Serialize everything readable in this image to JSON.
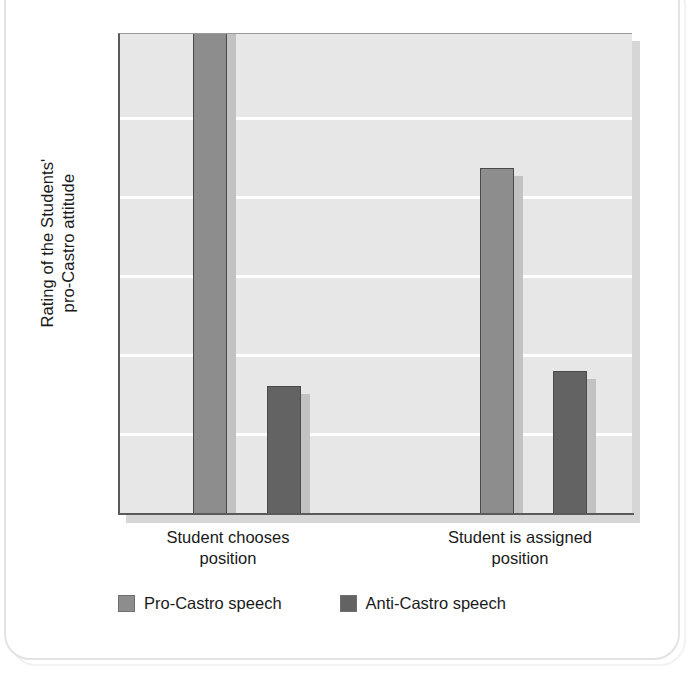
{
  "figure": {
    "ylabel": "Rating of the Students'\npro-Castro attitude",
    "plot_bg": "#e7e7e7",
    "gridline_color": "#ffffff",
    "axis_color": "#5a5a5a"
  },
  "legend": {
    "items": [
      {
        "label": "Pro-Castro speech",
        "color": "#8d8d8d"
      },
      {
        "label": "Anti-Castro speech",
        "color": "#636363"
      }
    ]
  },
  "chart_data": {
    "type": "bar",
    "title": "",
    "xlabel": "",
    "ylabel": "Rating of the Students' pro-Castro attitude",
    "categories": [
      "Student chooses\nposition",
      "Student is assigned\nposition"
    ],
    "category_labels_flat": [
      "Student chooses position",
      "Student is assigned position"
    ],
    "series": [
      {
        "name": "Pro-Castro speech",
        "color": "#8d8d8d",
        "values": [
          6.35,
          4.45
        ]
      },
      {
        "name": "Anti-Castro speech",
        "color": "#636363",
        "values": [
          1.68,
          1.88
        ]
      }
    ],
    "ylim": [
      0,
      6.1
    ],
    "grid": true,
    "gridlines_y": [
      1,
      2,
      3,
      4,
      5,
      6
    ],
    "y_tick_labels": [],
    "legend_position": "bottom"
  },
  "geometry": {
    "plot": {
      "left": 118,
      "top": 33,
      "width": 514,
      "height": 482
    },
    "gridline_y": [
      116,
      195,
      274,
      353,
      432
    ],
    "bars": [
      {
        "series": "Pro-Castro speech",
        "group": 0,
        "x": 191,
        "width": 34,
        "top": -6,
        "bottom": 513
      },
      {
        "series": "Anti-Castro speech",
        "group": 0,
        "x": 265,
        "width": 34,
        "top": 385,
        "bottom": 513
      },
      {
        "series": "Pro-Castro speech",
        "group": 1,
        "x": 478,
        "width": 34,
        "top": 167,
        "bottom": 513
      },
      {
        "series": "Anti-Castro speech",
        "group": 1,
        "x": 551,
        "width": 34,
        "top": 370,
        "bottom": 513
      }
    ]
  }
}
